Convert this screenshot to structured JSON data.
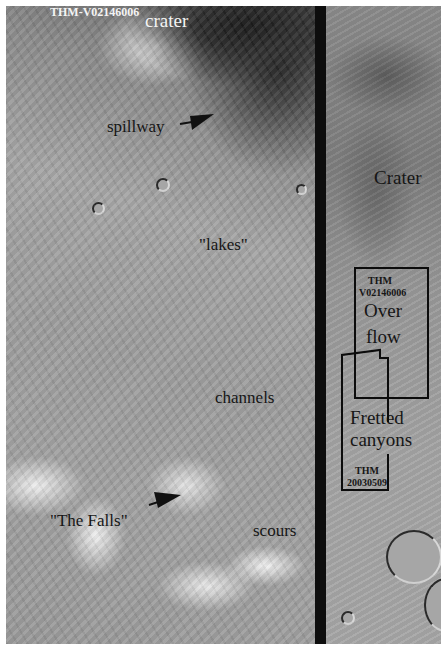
{
  "image": {
    "description": "Annotated mosaic of Martian terrain",
    "image_id_label": "THM-V02146006"
  },
  "labels": {
    "image_id": "THM-V02146006",
    "crater_top": "crater",
    "spillway": "spillway",
    "lakes": "\"lakes\"",
    "channels": "channels",
    "the_falls": "\"The Falls\"",
    "scours": "scours",
    "crater_right": "Crater",
    "box1_id_line1": "THM",
    "box1_id_line2": "V02146006",
    "overflow_line1": "Over",
    "overflow_line2": "flow",
    "fretted_line1": "Fretted",
    "fretted_line2": "canyons",
    "box2_id_line1": "THM",
    "box2_id_line2": "20030509"
  },
  "colors": {
    "divider": "#0d0d0d",
    "label_dark": "#161616",
    "label_light": "#f4f4f4",
    "box_outline": "#0c0c0c"
  }
}
